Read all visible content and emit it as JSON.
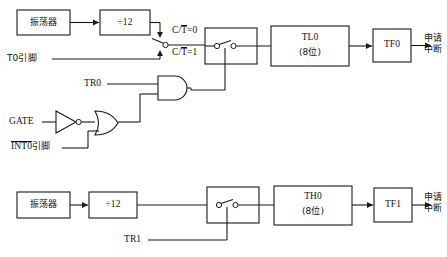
{
  "diagram": {
    "colors": {
      "line": "#1a1a1a",
      "text": "#111111",
      "background": "#ffffff"
    },
    "timer0": {
      "oscillator_label": "振荡器",
      "divider_label": "÷12",
      "pin_label": "T0引脚",
      "select_label_top_prefix": "C/",
      "select_label_top_overline": "T",
      "select_label_top_suffix": "=0",
      "select_label_bottom_prefix": "C/",
      "select_label_bottom_overline": "T",
      "select_label_bottom_suffix": "=1",
      "run_control_label": "TR0",
      "gate_label": "GATE",
      "int_pin_overline": "INT0",
      "int_pin_suffix": "引脚",
      "counter_label": "TL0",
      "counter_width": "(8位)",
      "flag_label": "TF0",
      "interrupt_label_line1": "申请",
      "interrupt_label_line2": "中断"
    },
    "timer1": {
      "oscillator_label": "振荡器",
      "divider_label": "÷12",
      "run_control_label": "TR1",
      "counter_label": "TH0",
      "counter_width": "(8位)",
      "flag_label": "TF1",
      "interrupt_label_line1": "申请",
      "interrupt_label_line2": "中断"
    },
    "symbols": {
      "not_gate": "inverter-gate",
      "or_gate": "or-gate",
      "and_gate": "and-gate",
      "switch": "spdt-switch"
    }
  }
}
